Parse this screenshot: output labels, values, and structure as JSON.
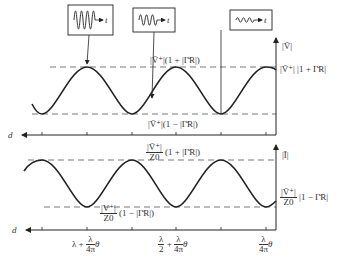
{
  "upper_plot": {
    "y_axis_label": "|V̄|",
    "x_axis_label": "d",
    "max_label": "|V̄⁺|(1 + |Γ̄R|)",
    "min_label": "|V̄⁺|(1 − |Γ̄R|)",
    "right_value_label": "|V̄⁺| |1 + Γ̄R|",
    "waveform_boxes": [
      {
        "label": "t",
        "amplitude": "large"
      },
      {
        "label": "t",
        "amplitude": "medium"
      },
      {
        "label": "t",
        "amplitude": "small"
      }
    ]
  },
  "lower_plot": {
    "y_axis_label": "|Ī|",
    "x_axis_label": "d",
    "max_num": "|V̄⁺|",
    "max_den": "Z0",
    "max_factor": "(1 + |Γ̄R|)",
    "min_num": "|V⁺|",
    "min_den": "Z0",
    "min_factor": "(1 − |Γ̄R|)",
    "right_num": "|V̄⁺|",
    "right_den": "Z0",
    "right_factor": "|1 − Γ̄R|"
  },
  "x_ticks": [
    {
      "prefix": "λ +",
      "num": "λ",
      "den": "4π",
      "suffix": "θ"
    },
    {
      "pre_num": "λ",
      "pre_den": "2",
      "prefix": "+",
      "num": "λ",
      "den": "4π",
      "suffix": "θ"
    },
    {
      "num": "λ",
      "den": "4π",
      "suffix": "θ"
    }
  ],
  "colors": {
    "line": "#222222",
    "dashed": "#555555",
    "background": "#ffffff"
  }
}
